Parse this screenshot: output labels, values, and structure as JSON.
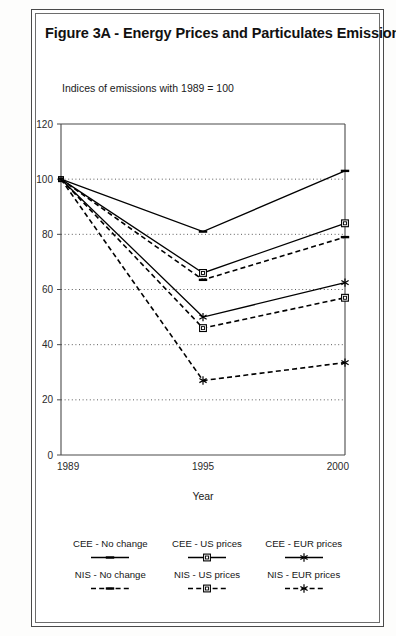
{
  "figure": {
    "title": "Figure 3A - Energy Prices and Particulates Emissions",
    "subtitle": "Indices of emissions with 1989 = 100"
  },
  "chart_data": {
    "type": "line",
    "title": "Figure 3A - Energy Prices and Particulates Emissions",
    "subtitle": "Indices of emissions with 1989 = 100",
    "xlabel": "Year",
    "ylabel": "",
    "categories": [
      "1989",
      "1995",
      "2000"
    ],
    "x": [
      1989,
      1995,
      2000
    ],
    "ylim": [
      0,
      120
    ],
    "yticks": [
      0,
      20,
      40,
      60,
      80,
      100,
      120
    ],
    "ytick_labels": [
      "0",
      "20",
      "40",
      "60",
      "80",
      "100",
      "120"
    ],
    "grid": "horizontal-dotted",
    "legend_position": "below-plot",
    "series": [
      {
        "name": "CEE - No change",
        "values": [
          100,
          81,
          103
        ],
        "style": "solid",
        "marker": "dash",
        "color": "#000000"
      },
      {
        "name": "CEE - US prices",
        "values": [
          100,
          66,
          84
        ],
        "style": "solid",
        "marker": "square",
        "color": "#000000"
      },
      {
        "name": "CEE - EUR prices",
        "values": [
          100,
          50,
          62.5
        ],
        "style": "solid",
        "marker": "asterisk",
        "color": "#000000"
      },
      {
        "name": "NIS - No change",
        "values": [
          100,
          63.5,
          79
        ],
        "style": "dashed",
        "marker": "dash",
        "color": "#000000"
      },
      {
        "name": "NIS - US prices",
        "values": [
          100,
          46,
          57
        ],
        "style": "dashed",
        "marker": "square",
        "color": "#000000"
      },
      {
        "name": "NIS - EUR prices",
        "values": [
          100,
          27,
          33.5
        ],
        "style": "dashed",
        "marker": "asterisk",
        "color": "#000000"
      }
    ]
  },
  "legend": {
    "rows": [
      [
        {
          "label": "CEE - No change",
          "style": "solid",
          "marker": "dash"
        },
        {
          "label": "CEE - US prices",
          "style": "solid",
          "marker": "square"
        },
        {
          "label": "CEE - EUR prices",
          "style": "solid",
          "marker": "asterisk"
        }
      ],
      [
        {
          "label": "NIS - No change",
          "style": "dashed",
          "marker": "dash"
        },
        {
          "label": "NIS - US prices",
          "style": "dashed",
          "marker": "square"
        },
        {
          "label": "NIS - EUR prices",
          "style": "dashed",
          "marker": "asterisk"
        }
      ]
    ]
  }
}
